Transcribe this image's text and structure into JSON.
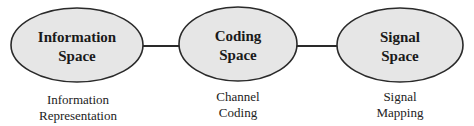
{
  "diagram": {
    "colors": {
      "node_fill": "#e6e6e6",
      "node_stroke": "#2a2a2a",
      "edge": "#2a2a2a",
      "text": "#1a1a1a"
    },
    "nodes": [
      {
        "id": "information-space",
        "title_line1": "Information",
        "title_line2": "Space",
        "caption_line1": "Information",
        "caption_line2": "Representation"
      },
      {
        "id": "coding-space",
        "title_line1": "Coding",
        "title_line2": "Space",
        "caption_line1": "Channel",
        "caption_line2": "Coding"
      },
      {
        "id": "signal-space",
        "title_line1": "Signal",
        "title_line2": "Space",
        "caption_line1": "Signal",
        "caption_line2": "Mapping"
      }
    ],
    "edges": [
      {
        "from": "information-space",
        "to": "coding-space"
      },
      {
        "from": "coding-space",
        "to": "signal-space"
      }
    ]
  }
}
